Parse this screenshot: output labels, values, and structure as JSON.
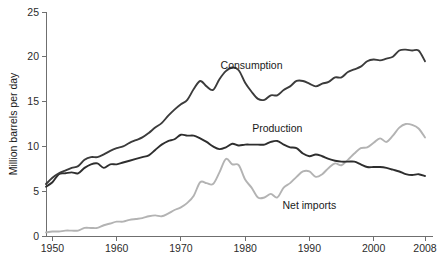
{
  "chart_data": {
    "type": "line",
    "title": "",
    "subtitle": "",
    "xlabel": "",
    "ylabel": "Million barrels per day",
    "xlim": [
      1949,
      2008
    ],
    "ylim": [
      0,
      25
    ],
    "grid": false,
    "legend_position": "inline-annotations",
    "x_ticks": [
      "1950",
      "1960",
      "1970",
      "1980",
      "1990",
      "2000",
      "2008"
    ],
    "x_tick_values": [
      1950,
      1960,
      1970,
      1980,
      1990,
      2000,
      2008
    ],
    "y_ticks": [
      "0",
      "5",
      "10",
      "15",
      "20",
      "25"
    ],
    "y_tick_values": [
      0,
      5,
      10,
      15,
      20,
      25
    ],
    "x": [
      1949,
      1950,
      1951,
      1952,
      1953,
      1954,
      1955,
      1956,
      1957,
      1958,
      1959,
      1960,
      1961,
      1962,
      1963,
      1964,
      1965,
      1966,
      1967,
      1968,
      1969,
      1970,
      1971,
      1972,
      1973,
      1974,
      1975,
      1976,
      1977,
      1978,
      1979,
      1980,
      1981,
      1982,
      1983,
      1984,
      1985,
      1986,
      1987,
      1988,
      1989,
      1990,
      1991,
      1992,
      1993,
      1994,
      1995,
      1996,
      1997,
      1998,
      1999,
      2000,
      2001,
      2002,
      2003,
      2004,
      2005,
      2006,
      2007,
      2008
    ],
    "series": [
      {
        "name": "Consumption",
        "color": "#3b3b3b",
        "width": 1.9,
        "label_x": 1981,
        "label_y": 18.6,
        "values": [
          5.8,
          6.5,
          7.0,
          7.3,
          7.6,
          7.8,
          8.5,
          8.8,
          8.8,
          9.1,
          9.5,
          9.8,
          10.0,
          10.4,
          10.7,
          11.0,
          11.5,
          12.1,
          12.6,
          13.4,
          14.1,
          14.7,
          15.2,
          16.4,
          17.3,
          16.7,
          16.3,
          17.5,
          18.4,
          18.8,
          18.5,
          17.1,
          16.1,
          15.3,
          15.2,
          15.7,
          15.7,
          16.3,
          16.7,
          17.3,
          17.3,
          17.0,
          16.7,
          17.0,
          17.2,
          17.7,
          17.7,
          18.3,
          18.6,
          18.9,
          19.5,
          19.7,
          19.6,
          19.8,
          20.0,
          20.7,
          20.8,
          20.7,
          20.7,
          19.5
        ]
      },
      {
        "name": "Production",
        "color": "#2e2e2e",
        "width": 1.9,
        "label_x": 1985,
        "label_y": 11.6,
        "values": [
          5.5,
          6.0,
          6.9,
          7.0,
          7.1,
          7.0,
          7.6,
          8.0,
          8.1,
          7.6,
          8.0,
          8.0,
          8.2,
          8.4,
          8.6,
          8.8,
          9.0,
          9.6,
          10.2,
          10.6,
          10.8,
          11.3,
          11.2,
          11.2,
          10.9,
          10.5,
          10.0,
          9.7,
          9.9,
          10.3,
          10.1,
          10.2,
          10.2,
          10.2,
          10.2,
          10.5,
          10.6,
          10.2,
          9.9,
          9.8,
          9.2,
          8.9,
          9.1,
          8.9,
          8.6,
          8.4,
          8.3,
          8.3,
          8.3,
          8.0,
          7.7,
          7.7,
          7.7,
          7.6,
          7.4,
          7.2,
          6.9,
          6.8,
          6.9,
          6.7
        ]
      },
      {
        "name": "Net imports",
        "color": "#b3b3b3",
        "width": 1.9,
        "label_x": 1990,
        "label_y": 3.0,
        "values": [
          0.4,
          0.5,
          0.5,
          0.6,
          0.6,
          0.6,
          0.9,
          0.9,
          0.9,
          1.2,
          1.4,
          1.6,
          1.6,
          1.8,
          1.9,
          2.0,
          2.2,
          2.3,
          2.2,
          2.5,
          2.9,
          3.2,
          3.7,
          4.5,
          6.0,
          5.9,
          5.8,
          7.1,
          8.6,
          8.0,
          7.9,
          6.3,
          5.4,
          4.3,
          4.3,
          4.7,
          4.3,
          5.4,
          5.9,
          6.6,
          7.2,
          7.2,
          6.6,
          6.9,
          7.6,
          8.1,
          7.9,
          8.5,
          9.2,
          9.8,
          9.9,
          10.4,
          10.9,
          10.5,
          11.2,
          12.1,
          12.5,
          12.4,
          12.0,
          11.0
        ]
      }
    ]
  }
}
